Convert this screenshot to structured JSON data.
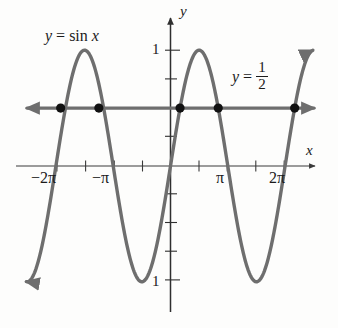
{
  "figure": {
    "background_color": "#fdfdfc",
    "curve_color": "#6e6e6e",
    "axis_color": "#3a3a3a",
    "point_color": "#111111",
    "text_color": "#1b1b1b"
  },
  "labels": {
    "sine_curve": {
      "lhs": "y",
      "eq": "=",
      "fn": "sin",
      "arg": "x",
      "full": "y = sin x"
    },
    "half_line": {
      "lhs": "y",
      "eq": "=",
      "numerator": "1",
      "denominator": "2",
      "full": "y = 1/2"
    },
    "axis_y": "y",
    "axis_x": "x"
  },
  "ticks": {
    "x": [
      {
        "label": "−2π",
        "value": -6.2832
      },
      {
        "label": "−π",
        "value": -3.1416
      },
      {
        "label": "π",
        "value": 3.1416
      },
      {
        "label": "2π",
        "value": 6.2832
      }
    ],
    "y": [
      {
        "label": "1",
        "value": 1
      },
      {
        "label": "1",
        "value": -1
      }
    ]
  },
  "chart_data": {
    "type": "line",
    "xlabel": "x",
    "ylabel": "y",
    "xlim": [
      -8.2,
      8.1
    ],
    "ylim": [
      -1.43,
      1.43
    ],
    "grid": false,
    "legend": "inline-annotations",
    "x_tick_values": [
      -6.2832,
      -3.1416,
      0,
      3.1416,
      6.2832
    ],
    "x_tick_labels": [
      "−2π",
      "−π",
      "",
      "π",
      "2π"
    ],
    "x_minor_tick_values": [
      -4.7124,
      -1.5708,
      1.5708,
      4.7124
    ],
    "y_tick_values": [
      1,
      0.75,
      0.5,
      0.25,
      0,
      -0.25,
      -0.5,
      -0.75,
      -1
    ],
    "y_tick_labels": [
      "1",
      "",
      "",
      "",
      "",
      "",
      "",
      "",
      "1"
    ],
    "series": [
      {
        "name": "y = sin x",
        "type": "line",
        "color": "#6e6e6e",
        "equation": "y = sin(x)",
        "arrows": [
          "start",
          "end"
        ],
        "x_range": [
          -7.9,
          7.8
        ],
        "key_points": {
          "maxima": [
            [
              -4.7124,
              1
            ],
            [
              1.5708,
              1
            ]
          ],
          "minima": [
            [
              -1.5708,
              -1
            ],
            [
              4.7124,
              -1
            ]
          ],
          "zeros": [
            -6.2832,
            -3.1416,
            0,
            3.1416,
            6.2832
          ]
        }
      },
      {
        "name": "y = 1/2",
        "type": "hline",
        "color": "#6e6e6e",
        "equation": "y = 0.5",
        "arrows": [
          "start",
          "end"
        ],
        "value": 0.5
      }
    ],
    "intersection_points": [
      {
        "x": -6.0214,
        "y": 0.5,
        "label": "-2π + π/6"
      },
      {
        "x": -3.927,
        "y": 0.5,
        "label": "-π - π/4 region"
      },
      {
        "x": 0.5236,
        "y": 0.5,
        "label": "π/6"
      },
      {
        "x": 2.618,
        "y": 0.5,
        "label": "5π/6"
      },
      {
        "x": 6.8068,
        "y": 0.5,
        "label": "2π + π/6"
      }
    ]
  }
}
